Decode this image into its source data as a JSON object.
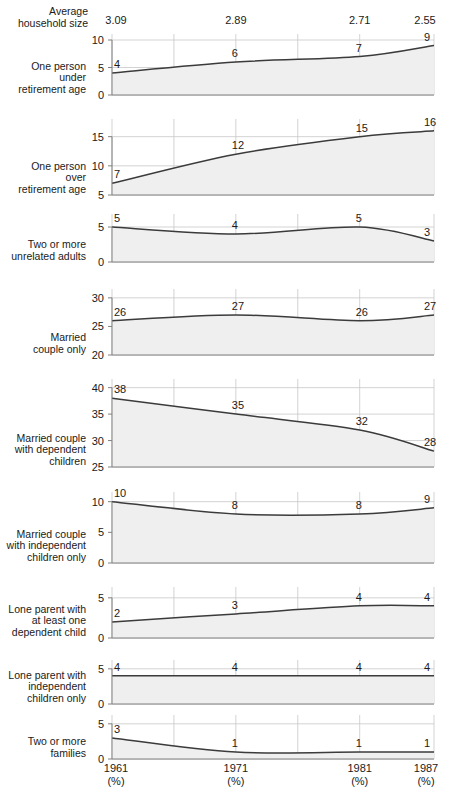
{
  "header": {
    "title": "Average\nhousehold size",
    "values": [
      {
        "label": "3.09",
        "x": 1961
      },
      {
        "label": "2.89",
        "x": 1971
      },
      {
        "label": "2.71",
        "x": 1981
      },
      {
        "label": "2.55",
        "x": 1987
      }
    ]
  },
  "axis": {
    "x_ticks": [
      {
        "year": "1961",
        "unit": "(%)"
      },
      {
        "year": "1971",
        "unit": "(%)"
      },
      {
        "year": "1981",
        "unit": "(%)"
      },
      {
        "year": "1987",
        "unit": "(%)"
      }
    ],
    "x_min": 1961,
    "x_max": 1987,
    "gridline_years": [
      1961,
      1966,
      1971,
      1976,
      1981,
      1987
    ]
  },
  "chart_data": {
    "type": "area",
    "xlabel": "",
    "ylabel": "%",
    "x": [
      1961,
      1971,
      1981,
      1987
    ],
    "grid": true,
    "legend": "none",
    "series": [
      {
        "name": "One person under retirement age",
        "label": "One person\nunder\nretirement age",
        "values": [
          4,
          6,
          7,
          9
        ],
        "ylim": [
          0,
          10
        ],
        "yticks": [
          0,
          5,
          10
        ]
      },
      {
        "name": "One person over retirement age",
        "label": "One person\nover\nretirement age",
        "values": [
          7,
          12,
          15,
          16
        ],
        "ylim": [
          5,
          17
        ],
        "yticks": [
          5,
          10,
          15
        ]
      },
      {
        "name": "Two or more unrelated adults",
        "label": "Two or more\nunrelated adults",
        "values": [
          5,
          4,
          5,
          3
        ],
        "ylim": [
          0,
          6
        ],
        "yticks": [
          0,
          5
        ]
      },
      {
        "name": "Married couple only",
        "label": "Married\ncouple only",
        "values": [
          26,
          27,
          26,
          27
        ],
        "ylim": [
          20,
          30.5
        ],
        "yticks": [
          20,
          25,
          30
        ]
      },
      {
        "name": "Married couple with dependent children",
        "label": "Married couple\nwith dependent\nchildren",
        "values": [
          38,
          35,
          32,
          28
        ],
        "ylim": [
          25,
          40.5
        ],
        "yticks": [
          25,
          30,
          35,
          40
        ]
      },
      {
        "name": "Married couple with independent children only",
        "label": "Married couple\nwith independent\nchildren only",
        "values": [
          10,
          8,
          8,
          9
        ],
        "ylim": [
          0,
          10.6
        ],
        "yticks": [
          0,
          5,
          10
        ]
      },
      {
        "name": "Lone parent with at least one dependent child",
        "label": "Lone parent with\nat least one\ndependent child",
        "values": [
          2,
          3,
          4,
          4
        ],
        "ylim": [
          0,
          5.6
        ],
        "yticks": [
          0,
          5
        ]
      },
      {
        "name": "Lone parent with independent children only",
        "label": "Lone parent with\nindependent\nchildren only",
        "values": [
          4,
          4,
          4,
          4
        ],
        "ylim": [
          0,
          5.4
        ],
        "yticks": [
          0,
          5
        ]
      },
      {
        "name": "Two or more families",
        "label": "Two or more\nfamilies",
        "values": [
          3,
          1,
          1,
          1
        ],
        "ylim": [
          0,
          5.4
        ],
        "yticks": [
          0,
          5
        ]
      }
    ]
  },
  "style": {
    "line_color": "#3b3b3b",
    "fill_color": "#efefef",
    "grid_color": "#c8c8c8",
    "axis_color": "#808080",
    "text_color": "#1a1a1a",
    "background": "#ffffff"
  },
  "layout": {
    "plot_left": 112,
    "plot_right": 434,
    "panels": [
      {
        "top": 40,
        "height": 55
      },
      {
        "top": 125,
        "height": 70
      },
      {
        "top": 220,
        "height": 42
      },
      {
        "top": 295,
        "height": 60
      },
      {
        "top": 385,
        "height": 82
      },
      {
        "top": 498,
        "height": 65
      },
      {
        "top": 593,
        "height": 45
      },
      {
        "top": 666,
        "height": 38
      },
      {
        "top": 721,
        "height": 38
      }
    ]
  }
}
